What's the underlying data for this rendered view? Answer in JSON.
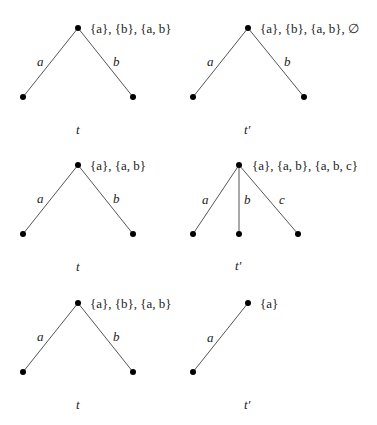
{
  "diagrams": [
    {
      "name": "t",
      "caption": "t",
      "root_label": "{a}, {b}, {a, b}",
      "edges": [
        {
          "label": "a"
        },
        {
          "label": "b"
        }
      ]
    },
    {
      "name": "t-prime",
      "caption": "t′",
      "root_label": "{a}, {b}, {a, b}, ∅",
      "edges": [
        {
          "label": "a"
        },
        {
          "label": "b"
        }
      ]
    },
    {
      "name": "t",
      "caption": "t",
      "root_label": "{a}, {a, b}",
      "edges": [
        {
          "label": "a"
        },
        {
          "label": "b"
        }
      ]
    },
    {
      "name": "t-prime",
      "caption": "t′",
      "root_label": "{a}, {a, b}, {a, b, c}",
      "edges": [
        {
          "label": "a"
        },
        {
          "label": "b"
        },
        {
          "label": "c"
        }
      ]
    },
    {
      "name": "t",
      "caption": "t",
      "root_label": "{a}, {b}, {a, b}",
      "edges": [
        {
          "label": "a"
        },
        {
          "label": "b"
        }
      ]
    },
    {
      "name": "t-prime",
      "caption": "t′",
      "root_label": "{a}",
      "edges": [
        {
          "label": "a"
        }
      ]
    }
  ]
}
